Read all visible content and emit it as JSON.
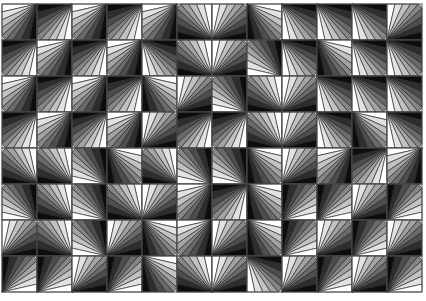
{
  "image": {
    "description": "Op-art mosaic of square tiles, each filled with a fan of grayscale wedges radiating from a corner",
    "width": 426,
    "height": 301,
    "background": "#ffffff",
    "grid": {
      "origin_x": 2,
      "origin_y": 4,
      "cols": 12,
      "rows": 8,
      "tile_w": 35,
      "tile_h": 36,
      "line_color": "#555555"
    },
    "palette": [
      "#0d0d0d",
      "#2e2e2e",
      "#4d4d4d",
      "#6a6a6a",
      "#868686",
      "#a3a3a3",
      "#c2c2c2",
      "#e2e2e2",
      "#ffffff"
    ],
    "wedges_per_tile": 9,
    "tiles": [
      [
        "tr-L",
        "tr-D",
        "tr-L",
        "tr-D",
        "tr-L",
        "br-L",
        "bl-L",
        "tl-L",
        "tl-D",
        "tl-D",
        "tl-D",
        "bl-L"
      ],
      [
        "tr-D",
        "tr-L",
        "tr-D",
        "tr-L",
        "tl-D",
        "br-L",
        "bl-L",
        "br-D",
        "tl-D",
        "tl-L",
        "tl-D",
        "tl-D"
      ],
      [
        "tr-L",
        "tr-D",
        "tr-L",
        "tr-D",
        "tl-L",
        "bl-L",
        "br-D",
        "br-L",
        "bl-L",
        "tl-D",
        "tl-D",
        "tl-D"
      ],
      [
        "tr-D",
        "tr-L",
        "tr-D",
        "tr-L",
        "bl-L",
        "tr-D",
        "tr-D",
        "br-L",
        "bl-L",
        "tl-D",
        "tl-L",
        "tl-D"
      ],
      [
        "br-L",
        "br-L",
        "br-D",
        "tl-L",
        "br-L",
        "br-D",
        "br-D",
        "tl-L",
        "bl-L",
        "tr-L",
        "tr-D",
        "tr-L"
      ],
      [
        "br-D",
        "br-L",
        "br-D",
        "br-L",
        "bl-L",
        "tr-L",
        "tr-D",
        "tl-L",
        "bl-D",
        "bl-D",
        "bl-L",
        "bl-D"
      ],
      [
        "bl-L",
        "br-L",
        "br-D",
        "bl-L",
        "tl-L",
        "tr-L",
        "bl-L",
        "tl-L",
        "bl-D",
        "bl-L",
        "bl-D",
        "bl-L"
      ],
      [
        "bl-D",
        "bl-D",
        "bl-L",
        "bl-D",
        "tl-L",
        "br-L",
        "bl-L",
        "tl-D",
        "bl-L",
        "bl-D",
        "bl-L",
        "bl-D"
      ]
    ]
  }
}
